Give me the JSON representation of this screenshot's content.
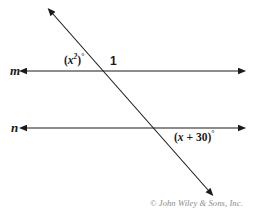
{
  "figure": {
    "background_color": "#ffffff",
    "stroke_color": "#1a1a1a",
    "copyright": "© John Wiley & Sons, Inc.",
    "copyright_color": "#8a8a8a"
  },
  "lines": {
    "m": {
      "name": "m",
      "y": 71,
      "x_start": 27,
      "x_end": 238,
      "double_arrow": true
    },
    "n": {
      "name": "n",
      "y": 128,
      "x_start": 27,
      "x_end": 238,
      "double_arrow": true
    },
    "transversal": {
      "name": "transversal",
      "x_start": 53,
      "y_start": 14,
      "x_end": 208,
      "y_end": 190,
      "double_arrow": true
    }
  },
  "intersections": {
    "with_m": {
      "x": 103,
      "y": 71
    },
    "with_n": {
      "x": 156,
      "y": 128
    }
  },
  "labels": {
    "line_m": "m",
    "line_n": "n",
    "angle_1": "1",
    "angle_x_squared": {
      "open_paren": "(",
      "variable": "x",
      "exponent": "2",
      "close_paren": ")",
      "degree": "°",
      "full_text": "(x²)°"
    },
    "angle_x_plus_30": {
      "open_paren": "(",
      "variable": "x",
      "operator": " + ",
      "constant": "30",
      "close_paren": ")",
      "degree": "°",
      "full_text": "(x + 30)°"
    }
  }
}
